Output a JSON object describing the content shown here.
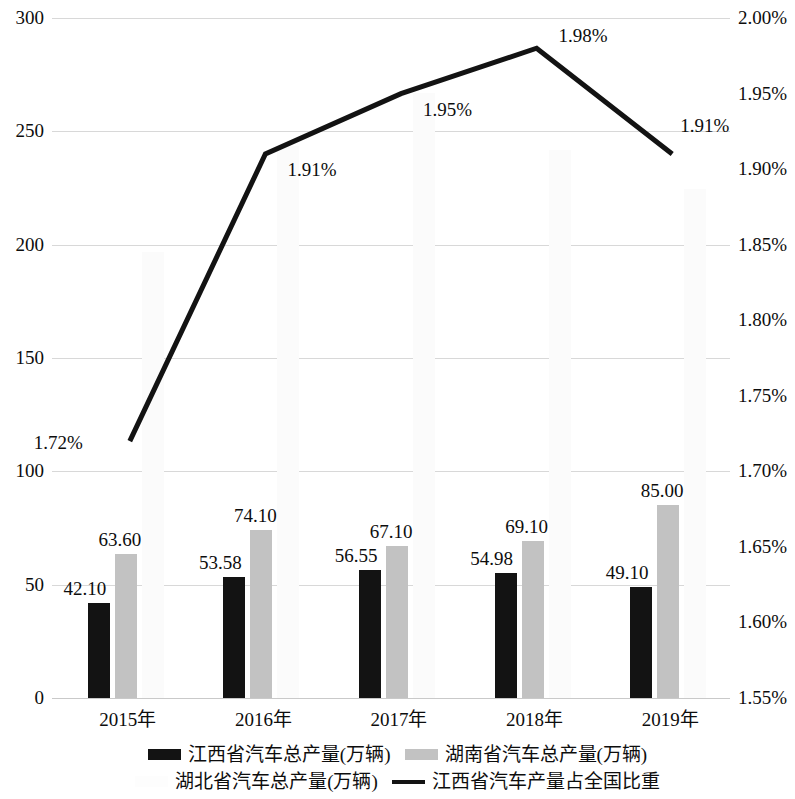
{
  "chart_data": {
    "type": "bar",
    "title": "",
    "subtitle": "",
    "xlabel": "",
    "ylabel": "",
    "categories": [
      "2015年",
      "2016年",
      "2017年",
      "2018年",
      "2019年"
    ],
    "left_axis": {
      "ylim": [
        0,
        300
      ],
      "step": 50,
      "ticks": [
        "0",
        "50",
        "100",
        "150",
        "200",
        "250",
        "300"
      ],
      "tick_values": [
        0,
        50,
        100,
        150,
        200,
        250,
        300
      ]
    },
    "right_axis": {
      "ylim": [
        1.55,
        2.0
      ],
      "step": 0.05,
      "ticks": [
        "1.55%",
        "1.60%",
        "1.65%",
        "1.70%",
        "1.75%",
        "1.80%",
        "1.85%",
        "1.90%",
        "1.95%",
        "2.00%"
      ],
      "tick_values": [
        1.55,
        1.6,
        1.65,
        1.7,
        1.75,
        1.8,
        1.85,
        1.9,
        1.95,
        2.0
      ]
    },
    "grid": true,
    "legend_position": "bottom",
    "series": [
      {
        "name": "江西省汽车总产量(万辆)",
        "kind": "bar",
        "axis": "left",
        "color": "#131313",
        "values": [
          42.1,
          53.58,
          56.55,
          54.98,
          49.1
        ],
        "labels": [
          "42.10",
          "53.58",
          "56.55",
          "54.98",
          "49.10"
        ]
      },
      {
        "name": "湖南省汽车总产量(万辆)",
        "kind": "bar",
        "axis": "left",
        "color": "#c2c2c2",
        "values": [
          63.6,
          74.1,
          67.1,
          69.1,
          85.0
        ],
        "labels": [
          "63.60",
          "74.10",
          "67.10",
          "69.10",
          "85.00"
        ]
      },
      {
        "name": "湖北省汽车总产量(万辆)",
        "kind": "bar",
        "axis": "left",
        "color": "#fbfbfb",
        "values": [
          196.8,
          243.7,
          266.98,
          241.93,
          224.75
        ],
        "labels": [
          "196.80",
          "243.70",
          "266.98",
          "241.93",
          "224.75"
        ]
      },
      {
        "name": "江西省汽车产量占全国比重",
        "kind": "line",
        "axis": "right",
        "color": "#131313",
        "values": [
          1.72,
          1.91,
          1.95,
          1.98,
          1.91
        ],
        "labels": [
          "1.72%",
          "1.91%",
          "1.95%",
          "1.98%",
          "1.91%"
        ]
      }
    ]
  },
  "legend": {
    "rows": [
      [
        {
          "swatch": "bar-black",
          "label": "江西省汽车总产量(万辆)"
        },
        {
          "swatch": "bar-gray",
          "label": "湖南省汽车总产量(万辆)"
        }
      ],
      [
        {
          "swatch": "bar-white",
          "label": "湖北省汽车总产量(万辆)"
        },
        {
          "swatch": "line-black",
          "label": "江西省汽车产量占全国比重"
        }
      ]
    ]
  },
  "colors": {
    "jiangxi_bar": "#131313",
    "hunan_bar": "#c2c2c2",
    "hubei_bar": "#fbfbfb",
    "line": "#131313",
    "gridline": "#d8d8d8",
    "text": "#0d0d0d",
    "background": "#ffffff"
  }
}
